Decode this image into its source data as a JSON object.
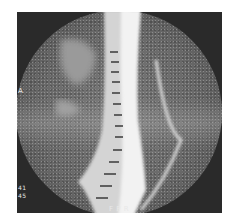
{
  "image": {
    "type": "MRI sagittal spine",
    "labels": {
      "orientation_left": "A",
      "bottom_center": "F P R",
      "bottom_left_line1": "41",
      "bottom_left_line2": "45"
    },
    "colors": {
      "background": "#ffffff",
      "frame": "#2a2a2a",
      "fov": "#6a6a6a",
      "spine_bright": "#f0f0f0"
    }
  }
}
